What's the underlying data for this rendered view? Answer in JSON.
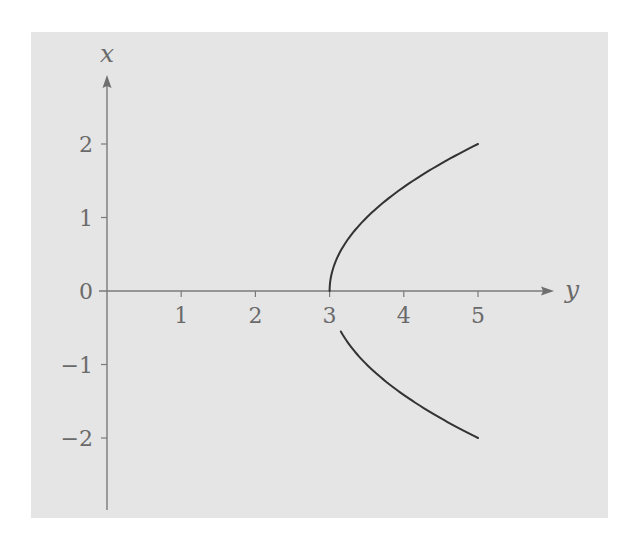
{
  "chart_data": {
    "type": "line",
    "title": "",
    "equation": "y = 3 + x^2/2",
    "horizontal_axis": {
      "label": "y",
      "range": [
        0,
        5.9
      ],
      "ticks": [
        1,
        2,
        3,
        4,
        5
      ],
      "tick_labels": [
        "1",
        "2",
        "3",
        "4",
        "5"
      ],
      "arrow": true
    },
    "vertical_axis": {
      "label": "x",
      "range": [
        -2.95,
        2.95
      ],
      "ticks": [
        2,
        1,
        0,
        -1,
        -2
      ],
      "tick_labels": [
        "2",
        "1",
        "0",
        "−1",
        "−2"
      ],
      "arrow": true
    },
    "grid": false,
    "legend": null,
    "series": [
      {
        "name": "upper-branch",
        "relation": "y = 3 + x^2/2",
        "x_range": [
          0,
          2
        ],
        "points": [
          [
            3,
            0
          ],
          [
            3.125,
            0.5
          ],
          [
            3.5,
            1
          ],
          [
            4.125,
            1.5
          ],
          [
            5,
            2
          ]
        ]
      },
      {
        "name": "lower-branch",
        "relation": "y = 3 + x^2/2",
        "x_range": [
          -0.55,
          -2
        ],
        "points": [
          [
            3.15,
            -0.55
          ],
          [
            3.5,
            -1
          ],
          [
            4.125,
            -1.5
          ],
          [
            5,
            -2
          ]
        ]
      }
    ]
  },
  "colors": {
    "background": "#e5e5e5",
    "axis": "#7a7a7a",
    "curve": "#333333",
    "text": "#6a6a6a"
  }
}
